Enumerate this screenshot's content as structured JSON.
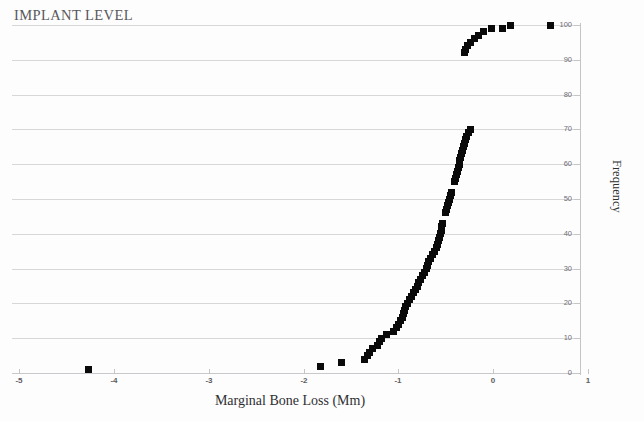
{
  "title": "IMPLANT LEVEL",
  "chart_data": {
    "type": "scatter",
    "title": "IMPLANT LEVEL",
    "xlabel": "Marginal Bone Loss (Mm)",
    "ylabel": "Frequency",
    "xlim": [
      -5,
      1
    ],
    "ylim": [
      0,
      100
    ],
    "xticks": [
      -5,
      -4,
      -3,
      -2,
      -1,
      0,
      1
    ],
    "xtick_labels": [
      "-5",
      "-4",
      "-3",
      "-2",
      "-1",
      "0",
      "1"
    ],
    "yticks": [
      0,
      10,
      20,
      30,
      40,
      50,
      60,
      70,
      80,
      90,
      100
    ],
    "ytick_labels": [
      "0",
      "10",
      "20",
      "30",
      "40",
      "50",
      "60",
      "70",
      "80",
      "90",
      "100"
    ],
    "grid": "horizontal",
    "y_axis_position": "right",
    "legend": "none",
    "marker": "filled-square",
    "series": [
      {
        "name": "Cumulative frequency",
        "points": [
          [
            -4.27,
            1
          ],
          [
            -1.82,
            2
          ],
          [
            -1.6,
            3
          ],
          [
            -1.36,
            4
          ],
          [
            -1.33,
            5
          ],
          [
            -1.3,
            6
          ],
          [
            -1.27,
            7
          ],
          [
            -1.22,
            8
          ],
          [
            -1.2,
            9
          ],
          [
            -1.18,
            10
          ],
          [
            -1.12,
            11
          ],
          [
            -1.05,
            12
          ],
          [
            -1.02,
            13
          ],
          [
            -1.0,
            14
          ],
          [
            -0.98,
            15
          ],
          [
            -0.96,
            16
          ],
          [
            -0.95,
            17
          ],
          [
            -0.93,
            18
          ],
          [
            -0.92,
            19
          ],
          [
            -0.9,
            20
          ],
          [
            -0.88,
            21
          ],
          [
            -0.86,
            22
          ],
          [
            -0.84,
            23
          ],
          [
            -0.82,
            24
          ],
          [
            -0.8,
            25
          ],
          [
            -0.79,
            26
          ],
          [
            -0.77,
            27
          ],
          [
            -0.75,
            28
          ],
          [
            -0.72,
            29
          ],
          [
            -0.7,
            30
          ],
          [
            -0.69,
            31
          ],
          [
            -0.68,
            32
          ],
          [
            -0.66,
            33
          ],
          [
            -0.64,
            34
          ],
          [
            -0.62,
            35
          ],
          [
            -0.6,
            36
          ],
          [
            -0.59,
            37
          ],
          [
            -0.58,
            38
          ],
          [
            -0.57,
            39
          ],
          [
            -0.56,
            40
          ],
          [
            -0.55,
            41
          ],
          [
            -0.54,
            42
          ],
          [
            -0.53,
            43
          ],
          [
            -0.5,
            46
          ],
          [
            -0.49,
            47
          ],
          [
            -0.48,
            48
          ],
          [
            -0.47,
            49
          ],
          [
            -0.46,
            50
          ],
          [
            -0.45,
            51
          ],
          [
            -0.44,
            52
          ],
          [
            -0.41,
            55
          ],
          [
            -0.4,
            56
          ],
          [
            -0.39,
            57
          ],
          [
            -0.38,
            58
          ],
          [
            -0.37,
            59
          ],
          [
            -0.36,
            60
          ],
          [
            -0.35,
            61
          ],
          [
            -0.34,
            62
          ],
          [
            -0.33,
            63
          ],
          [
            -0.32,
            64
          ],
          [
            -0.31,
            65
          ],
          [
            -0.3,
            66
          ],
          [
            -0.29,
            67
          ],
          [
            -0.28,
            68
          ],
          [
            -0.26,
            69
          ],
          [
            -0.24,
            70
          ],
          [
            -0.3,
            92
          ],
          [
            -0.29,
            93
          ],
          [
            -0.27,
            94
          ],
          [
            -0.24,
            95
          ],
          [
            -0.2,
            96
          ],
          [
            -0.15,
            97
          ],
          [
            -0.1,
            98
          ],
          [
            -0.02,
            99
          ],
          [
            0.1,
            99
          ],
          [
            0.18,
            100
          ],
          [
            0.6,
            100
          ]
        ]
      }
    ]
  }
}
